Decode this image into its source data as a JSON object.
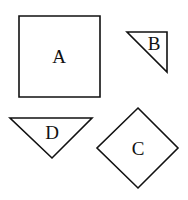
{
  "shapes": [
    {
      "id": "A",
      "label": "A",
      "type": "square",
      "points": [
        [
          19,
          16
        ],
        [
          100,
          16
        ],
        [
          100,
          97
        ],
        [
          19,
          97
        ]
      ],
      "label_pos": [
        59,
        63
      ]
    },
    {
      "id": "B",
      "label": "B",
      "type": "right-triangle",
      "points": [
        [
          127,
          32
        ],
        [
          167,
          32
        ],
        [
          167,
          72
        ]
      ],
      "label_pos": [
        154,
        50
      ]
    },
    {
      "id": "D",
      "label": "D",
      "type": "inverted-triangle",
      "points": [
        [
          10,
          118
        ],
        [
          92,
          118
        ],
        [
          52,
          158
        ]
      ],
      "label_pos": [
        52,
        137
      ]
    },
    {
      "id": "C",
      "label": "C",
      "type": "diamond",
      "points": [
        [
          138,
          108
        ],
        [
          178,
          148
        ],
        [
          138,
          188
        ],
        [
          97,
          148
        ]
      ],
      "label_pos": [
        138,
        154
      ]
    }
  ],
  "colors": {
    "stroke": "#111111",
    "fill": "#ffffff"
  }
}
